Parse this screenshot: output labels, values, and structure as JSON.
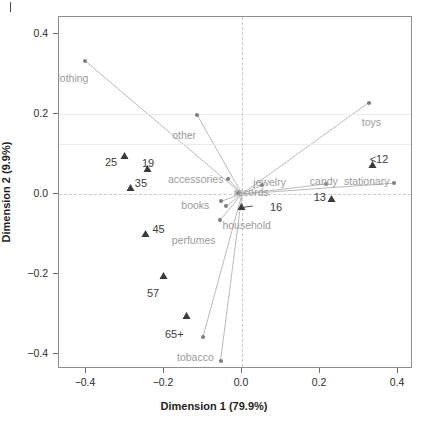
{
  "chart_data": {
    "type": "scatter",
    "title": "",
    "subtitle": "",
    "xlabel": "Dimension 1 (79.9%)",
    "ylabel": "Dimension 2 (9.9%)",
    "xlim": [
      -0.47,
      0.44
    ],
    "ylim": [
      -0.455,
      0.44
    ],
    "xticks": [
      -0.4,
      -0.2,
      0.0,
      0.2,
      0.4
    ],
    "xtick_labels": [
      "−0.4",
      "−0.2",
      "0.0",
      "0.2",
      "0.4"
    ],
    "yticks": [
      0.4,
      0.2,
      0.0,
      -0.2,
      -0.4
    ],
    "ytick_labels": [
      "0.4",
      "0.2",
      "0.0",
      "−0.2",
      "−0.4"
    ],
    "grid": "faint horizontal gridlines at y=0.2 and y=0.125; dashed reference lines at x=0 and y=0",
    "legend_position": "none",
    "series": [
      {
        "name": "columns",
        "marker": "circle",
        "color": "#7d7d7d",
        "linked_to_origin": true,
        "points": [
          {
            "label": "clothing",
            "x": -0.402,
            "y": 0.332,
            "label_dx": -33,
            "label_dy": 12
          },
          {
            "label": "other",
            "x": -0.115,
            "y": 0.197,
            "label_dx": -25,
            "label_dy": 15
          },
          {
            "label": "toys",
            "x": 0.325,
            "y": 0.228,
            "label_dx": -7,
            "label_dy": 14
          },
          {
            "label": "accessories",
            "x": -0.036,
            "y": 0.038,
            "label_dx": -60,
            "label_dy": -5
          },
          {
            "label": "jewelry",
            "x": 0.052,
            "y": 0.022,
            "label_dx": -9,
            "label_dy": -8
          },
          {
            "label": "candy",
            "x": 0.215,
            "y": 0.025,
            "label_dx": -16,
            "label_dy": -8
          },
          {
            "label": "stationary",
            "x": 0.39,
            "y": 0.027,
            "label_dx": -50,
            "label_dy": -7
          },
          {
            "label": "records",
            "x": -0.011,
            "y": 0.003,
            "label_dx": -4,
            "label_dy": -6
          },
          {
            "label": "books",
            "x": -0.053,
            "y": -0.018,
            "label_dx": -40,
            "label_dy": -1
          },
          {
            "label": "household",
            "x": -0.04,
            "y": -0.03,
            "label_dx": -4,
            "label_dy": 14
          },
          {
            "label": "perfumes",
            "x": -0.057,
            "y": -0.066,
            "label_dx": -48,
            "label_dy": 15
          },
          {
            "label": "tobacco",
            "x": -0.1,
            "y": -0.356,
            "label_dx": -26,
            "label_dy": 15
          },
          {
            "label": "hobby",
            "x": -0.055,
            "y": -0.416,
            "label_dx": -18,
            "label_dy": 15
          }
        ]
      },
      {
        "name": "rows",
        "marker": "triangle",
        "color": "#3b3b3b",
        "linked_to_origin": false,
        "points": [
          {
            "label": "<12",
            "x": 0.335,
            "y": 0.072,
            "label_dx": -3,
            "label_dy": -11
          },
          {
            "label": "13",
            "x": 0.23,
            "y": -0.012,
            "label_dx": -18,
            "label_dy": -7
          },
          {
            "label": "16",
            "x": 0.0,
            "y": -0.033,
            "label_dx": 28,
            "label_dy": -5
          },
          {
            "label": "19",
            "x": -0.241,
            "y": 0.062,
            "label_dx": -6,
            "label_dy": -11
          },
          {
            "label": "25",
            "x": -0.3,
            "y": 0.096,
            "label_dx": -20,
            "label_dy": 1
          },
          {
            "label": "35",
            "x": -0.285,
            "y": 0.016,
            "label_dx": 4,
            "label_dy": -10
          },
          {
            "label": "45",
            "x": -0.245,
            "y": -0.1,
            "label_dx": 6,
            "label_dy": -10
          },
          {
            "label": "57",
            "x": -0.2,
            "y": -0.205,
            "label_dx": -17,
            "label_dy": 12
          },
          {
            "label": "65+",
            "x": -0.141,
            "y": -0.305,
            "label_dx": -22,
            "label_dy": 13
          }
        ]
      }
    ],
    "annotations": [
      {
        "type": "arrow",
        "label": "16",
        "from_x": 0.028,
        "from_y": -0.03,
        "to_x": 0.005,
        "to_y": -0.033
      }
    ]
  }
}
